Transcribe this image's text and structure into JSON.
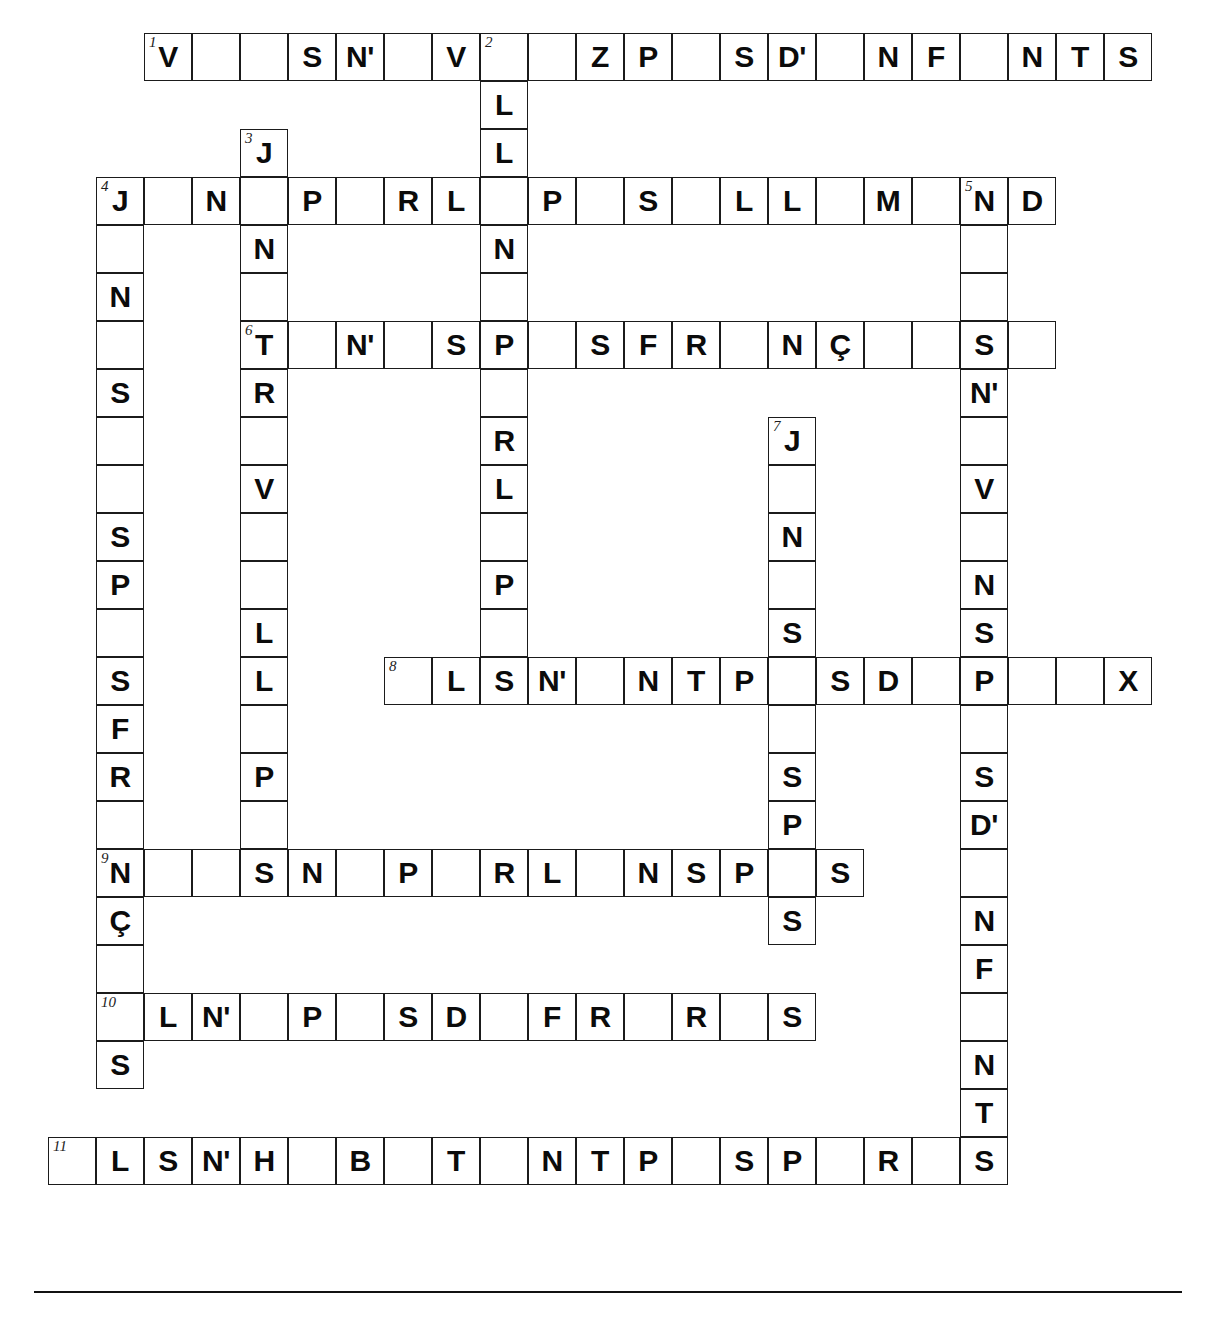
{
  "puzzle": {
    "title": "Crossword grid",
    "geometry": {
      "origin_x": 48,
      "origin_y": 33,
      "cell_size": 48,
      "cols": 24,
      "rows": 26
    },
    "footer_rule": true,
    "cells": [
      {
        "r": 0,
        "c": 2,
        "n": "1",
        "l": "V"
      },
      {
        "r": 0,
        "c": 3,
        "l": ""
      },
      {
        "r": 0,
        "c": 4,
        "l": ""
      },
      {
        "r": 0,
        "c": 5,
        "l": "S"
      },
      {
        "r": 0,
        "c": 6,
        "l": "N'"
      },
      {
        "r": 0,
        "c": 7,
        "l": ""
      },
      {
        "r": 0,
        "c": 8,
        "l": "V"
      },
      {
        "r": 0,
        "c": 9,
        "n": "2",
        "l": ""
      },
      {
        "r": 0,
        "c": 10,
        "l": ""
      },
      {
        "r": 0,
        "c": 11,
        "l": "Z"
      },
      {
        "r": 0,
        "c": 12,
        "l": "P"
      },
      {
        "r": 0,
        "c": 13,
        "l": ""
      },
      {
        "r": 0,
        "c": 14,
        "l": "S"
      },
      {
        "r": 0,
        "c": 15,
        "l": "D'"
      },
      {
        "r": 0,
        "c": 16,
        "l": ""
      },
      {
        "r": 0,
        "c": 17,
        "l": "N"
      },
      {
        "r": 0,
        "c": 18,
        "l": "F"
      },
      {
        "r": 0,
        "c": 19,
        "l": ""
      },
      {
        "r": 0,
        "c": 20,
        "l": "N"
      },
      {
        "r": 0,
        "c": 21,
        "l": "T"
      },
      {
        "r": 0,
        "c": 22,
        "l": "S"
      },
      {
        "r": 1,
        "c": 9,
        "l": "L"
      },
      {
        "r": 2,
        "c": 4,
        "n": "3",
        "l": "J"
      },
      {
        "r": 2,
        "c": 9,
        "l": "L"
      },
      {
        "r": 3,
        "c": 1,
        "n": "4",
        "l": "J"
      },
      {
        "r": 3,
        "c": 2,
        "l": ""
      },
      {
        "r": 3,
        "c": 3,
        "l": "N"
      },
      {
        "r": 3,
        "c": 4,
        "l": ""
      },
      {
        "r": 3,
        "c": 5,
        "l": "P"
      },
      {
        "r": 3,
        "c": 6,
        "l": ""
      },
      {
        "r": 3,
        "c": 7,
        "l": "R"
      },
      {
        "r": 3,
        "c": 8,
        "l": "L"
      },
      {
        "r": 3,
        "c": 9,
        "l": ""
      },
      {
        "r": 3,
        "c": 10,
        "l": "P"
      },
      {
        "r": 3,
        "c": 11,
        "l": ""
      },
      {
        "r": 3,
        "c": 12,
        "l": "S"
      },
      {
        "r": 3,
        "c": 13,
        "l": ""
      },
      {
        "r": 3,
        "c": 14,
        "l": "L"
      },
      {
        "r": 3,
        "c": 15,
        "l": "L"
      },
      {
        "r": 3,
        "c": 16,
        "l": ""
      },
      {
        "r": 3,
        "c": 17,
        "l": "M"
      },
      {
        "r": 3,
        "c": 18,
        "l": ""
      },
      {
        "r": 3,
        "c": 19,
        "n": "5",
        "l": "N"
      },
      {
        "r": 3,
        "c": 20,
        "l": "D"
      },
      {
        "r": 4,
        "c": 1,
        "l": ""
      },
      {
        "r": 4,
        "c": 4,
        "l": "N"
      },
      {
        "r": 4,
        "c": 9,
        "l": "N"
      },
      {
        "r": 4,
        "c": 19,
        "l": ""
      },
      {
        "r": 5,
        "c": 1,
        "l": "N"
      },
      {
        "r": 5,
        "c": 4,
        "l": ""
      },
      {
        "r": 5,
        "c": 9,
        "l": ""
      },
      {
        "r": 5,
        "c": 19,
        "l": ""
      },
      {
        "r": 6,
        "c": 1,
        "l": ""
      },
      {
        "r": 6,
        "c": 4,
        "n": "6",
        "l": "T"
      },
      {
        "r": 6,
        "c": 5,
        "l": ""
      },
      {
        "r": 6,
        "c": 6,
        "l": "N'"
      },
      {
        "r": 6,
        "c": 7,
        "l": ""
      },
      {
        "r": 6,
        "c": 8,
        "l": "S"
      },
      {
        "r": 6,
        "c": 9,
        "l": "P"
      },
      {
        "r": 6,
        "c": 10,
        "l": ""
      },
      {
        "r": 6,
        "c": 11,
        "l": "S"
      },
      {
        "r": 6,
        "c": 12,
        "l": "F"
      },
      {
        "r": 6,
        "c": 13,
        "l": "R"
      },
      {
        "r": 6,
        "c": 14,
        "l": ""
      },
      {
        "r": 6,
        "c": 15,
        "l": "N"
      },
      {
        "r": 6,
        "c": 16,
        "l": "Ç"
      },
      {
        "r": 6,
        "c": 17,
        "l": ""
      },
      {
        "r": 6,
        "c": 18,
        "l": ""
      },
      {
        "r": 6,
        "c": 19,
        "l": "S"
      },
      {
        "r": 6,
        "c": 20,
        "l": ""
      },
      {
        "r": 7,
        "c": 1,
        "l": "S"
      },
      {
        "r": 7,
        "c": 4,
        "l": "R"
      },
      {
        "r": 7,
        "c": 9,
        "l": ""
      },
      {
        "r": 7,
        "c": 19,
        "l": "N'"
      },
      {
        "r": 8,
        "c": 1,
        "l": ""
      },
      {
        "r": 8,
        "c": 4,
        "l": ""
      },
      {
        "r": 8,
        "c": 9,
        "l": "R"
      },
      {
        "r": 8,
        "c": 15,
        "n": "7",
        "l": "J"
      },
      {
        "r": 8,
        "c": 19,
        "l": ""
      },
      {
        "r": 9,
        "c": 1,
        "l": ""
      },
      {
        "r": 9,
        "c": 4,
        "l": "V"
      },
      {
        "r": 9,
        "c": 9,
        "l": "L"
      },
      {
        "r": 9,
        "c": 15,
        "l": ""
      },
      {
        "r": 9,
        "c": 19,
        "l": "V"
      },
      {
        "r": 10,
        "c": 1,
        "l": "S"
      },
      {
        "r": 10,
        "c": 4,
        "l": ""
      },
      {
        "r": 10,
        "c": 9,
        "l": ""
      },
      {
        "r": 10,
        "c": 15,
        "l": "N"
      },
      {
        "r": 10,
        "c": 19,
        "l": ""
      },
      {
        "r": 11,
        "c": 1,
        "l": "P"
      },
      {
        "r": 11,
        "c": 4,
        "l": ""
      },
      {
        "r": 11,
        "c": 9,
        "l": "P"
      },
      {
        "r": 11,
        "c": 15,
        "l": ""
      },
      {
        "r": 11,
        "c": 19,
        "l": "N"
      },
      {
        "r": 12,
        "c": 1,
        "l": ""
      },
      {
        "r": 12,
        "c": 4,
        "l": "L"
      },
      {
        "r": 12,
        "c": 9,
        "l": ""
      },
      {
        "r": 12,
        "c": 15,
        "l": "S"
      },
      {
        "r": 12,
        "c": 19,
        "l": "S"
      },
      {
        "r": 13,
        "c": 1,
        "l": "S"
      },
      {
        "r": 13,
        "c": 4,
        "l": "L"
      },
      {
        "r": 13,
        "c": 7,
        "n": "8",
        "l": ""
      },
      {
        "r": 13,
        "c": 8,
        "l": "L"
      },
      {
        "r": 13,
        "c": 9,
        "l": "S"
      },
      {
        "r": 13,
        "c": 10,
        "l": "N'"
      },
      {
        "r": 13,
        "c": 11,
        "l": ""
      },
      {
        "r": 13,
        "c": 12,
        "l": "N"
      },
      {
        "r": 13,
        "c": 13,
        "l": "T"
      },
      {
        "r": 13,
        "c": 14,
        "l": "P"
      },
      {
        "r": 13,
        "c": 15,
        "l": ""
      },
      {
        "r": 13,
        "c": 16,
        "l": "S"
      },
      {
        "r": 13,
        "c": 17,
        "l": "D"
      },
      {
        "r": 13,
        "c": 18,
        "l": ""
      },
      {
        "r": 13,
        "c": 19,
        "l": "P"
      },
      {
        "r": 13,
        "c": 20,
        "l": ""
      },
      {
        "r": 13,
        "c": 21,
        "l": ""
      },
      {
        "r": 13,
        "c": 22,
        "l": "X"
      },
      {
        "r": 14,
        "c": 1,
        "l": "F"
      },
      {
        "r": 14,
        "c": 4,
        "l": ""
      },
      {
        "r": 14,
        "c": 15,
        "l": ""
      },
      {
        "r": 14,
        "c": 19,
        "l": ""
      },
      {
        "r": 15,
        "c": 1,
        "l": "R"
      },
      {
        "r": 15,
        "c": 4,
        "l": "P"
      },
      {
        "r": 15,
        "c": 15,
        "l": "S"
      },
      {
        "r": 15,
        "c": 19,
        "l": "S"
      },
      {
        "r": 16,
        "c": 1,
        "l": ""
      },
      {
        "r": 16,
        "c": 4,
        "l": ""
      },
      {
        "r": 16,
        "c": 15,
        "l": "P"
      },
      {
        "r": 16,
        "c": 19,
        "l": "D'"
      },
      {
        "r": 17,
        "c": 1,
        "n": "9",
        "l": "N"
      },
      {
        "r": 17,
        "c": 2,
        "l": ""
      },
      {
        "r": 17,
        "c": 3,
        "l": ""
      },
      {
        "r": 17,
        "c": 4,
        "l": "S"
      },
      {
        "r": 17,
        "c": 5,
        "l": "N"
      },
      {
        "r": 17,
        "c": 6,
        "l": ""
      },
      {
        "r": 17,
        "c": 7,
        "l": "P"
      },
      {
        "r": 17,
        "c": 8,
        "l": ""
      },
      {
        "r": 17,
        "c": 9,
        "l": "R"
      },
      {
        "r": 17,
        "c": 10,
        "l": "L"
      },
      {
        "r": 17,
        "c": 11,
        "l": ""
      },
      {
        "r": 17,
        "c": 12,
        "l": "N"
      },
      {
        "r": 17,
        "c": 13,
        "l": "S"
      },
      {
        "r": 17,
        "c": 14,
        "l": "P"
      },
      {
        "r": 17,
        "c": 15,
        "l": ""
      },
      {
        "r": 17,
        "c": 16,
        "l": "S"
      },
      {
        "r": 17,
        "c": 19,
        "l": ""
      },
      {
        "r": 18,
        "c": 1,
        "l": "Ç"
      },
      {
        "r": 18,
        "c": 15,
        "l": "S"
      },
      {
        "r": 18,
        "c": 19,
        "l": "N"
      },
      {
        "r": 19,
        "c": 1,
        "l": ""
      },
      {
        "r": 19,
        "c": 19,
        "l": "F"
      },
      {
        "r": 20,
        "c": 1,
        "n": "10",
        "l": ""
      },
      {
        "r": 20,
        "c": 2,
        "l": "L"
      },
      {
        "r": 20,
        "c": 3,
        "l": "N'"
      },
      {
        "r": 20,
        "c": 4,
        "l": ""
      },
      {
        "r": 20,
        "c": 5,
        "l": "P"
      },
      {
        "r": 20,
        "c": 6,
        "l": ""
      },
      {
        "r": 20,
        "c": 7,
        "l": "S"
      },
      {
        "r": 20,
        "c": 8,
        "l": "D"
      },
      {
        "r": 20,
        "c": 9,
        "l": ""
      },
      {
        "r": 20,
        "c": 10,
        "l": "F"
      },
      {
        "r": 20,
        "c": 11,
        "l": "R"
      },
      {
        "r": 20,
        "c": 12,
        "l": ""
      },
      {
        "r": 20,
        "c": 13,
        "l": "R"
      },
      {
        "r": 20,
        "c": 14,
        "l": ""
      },
      {
        "r": 20,
        "c": 15,
        "l": "S"
      },
      {
        "r": 20,
        "c": 19,
        "l": ""
      },
      {
        "r": 21,
        "c": 1,
        "l": "S"
      },
      {
        "r": 21,
        "c": 19,
        "l": "N"
      },
      {
        "r": 22,
        "c": 19,
        "l": "T"
      },
      {
        "r": 23,
        "c": 0,
        "n": "11",
        "l": ""
      },
      {
        "r": 23,
        "c": 1,
        "l": "L"
      },
      {
        "r": 23,
        "c": 2,
        "l": "S"
      },
      {
        "r": 23,
        "c": 3,
        "l": "N'"
      },
      {
        "r": 23,
        "c": 4,
        "l": "H"
      },
      {
        "r": 23,
        "c": 5,
        "l": ""
      },
      {
        "r": 23,
        "c": 6,
        "l": "B"
      },
      {
        "r": 23,
        "c": 7,
        "l": ""
      },
      {
        "r": 23,
        "c": 8,
        "l": "T"
      },
      {
        "r": 23,
        "c": 9,
        "l": ""
      },
      {
        "r": 23,
        "c": 10,
        "l": "N"
      },
      {
        "r": 23,
        "c": 11,
        "l": "T"
      },
      {
        "r": 23,
        "c": 12,
        "l": "P"
      },
      {
        "r": 23,
        "c": 13,
        "l": ""
      },
      {
        "r": 23,
        "c": 14,
        "l": "S"
      },
      {
        "r": 23,
        "c": 15,
        "l": "P"
      },
      {
        "r": 23,
        "c": 16,
        "l": ""
      },
      {
        "r": 23,
        "c": 17,
        "l": "R"
      },
      {
        "r": 23,
        "c": 18,
        "l": ""
      },
      {
        "r": 23,
        "c": 19,
        "l": "S"
      }
    ],
    "across_entries": [
      {
        "number": "1",
        "row": 0,
        "letters": [
          "V",
          "",
          "",
          "S",
          "N'",
          "",
          "V",
          "",
          "",
          "Z",
          "P",
          "",
          "S",
          "D'",
          "",
          "N",
          "F",
          "",
          "N",
          "T",
          "S"
        ]
      },
      {
        "number": "4",
        "row": 3,
        "letters": [
          "J",
          "",
          "N",
          "",
          "P",
          "",
          "R",
          "L",
          "",
          "P",
          "",
          "S",
          "",
          "L",
          "L",
          "",
          "M",
          "",
          "N",
          "D"
        ]
      },
      {
        "number": "6",
        "row": 6,
        "letters": [
          "T",
          "",
          "N'",
          "",
          "S",
          "P",
          "",
          "S",
          "F",
          "R",
          "",
          "N",
          "Ç",
          "",
          "",
          "S",
          ""
        ]
      },
      {
        "number": "8",
        "row": 13,
        "letters": [
          "",
          "L",
          "S",
          "N'",
          "",
          "N",
          "T",
          "P",
          "",
          "S",
          "D",
          "",
          "P",
          "",
          "",
          "X"
        ]
      },
      {
        "number": "9",
        "row": 17,
        "letters": [
          "N",
          "",
          "",
          "S",
          "N",
          "",
          "P",
          "",
          "R",
          "L",
          "",
          "N",
          "S",
          "P",
          "",
          "S"
        ]
      },
      {
        "number": "10",
        "row": 20,
        "letters": [
          "",
          "L",
          "N'",
          "",
          "P",
          "",
          "S",
          "D",
          "",
          "F",
          "R",
          "",
          "R",
          "",
          "S"
        ]
      },
      {
        "number": "11",
        "row": 23,
        "letters": [
          "",
          "L",
          "S",
          "N'",
          "H",
          "",
          "B",
          "",
          "T",
          "",
          "N",
          "T",
          "P",
          "",
          "S",
          "P",
          "",
          "R",
          "",
          "S"
        ]
      }
    ],
    "down_entries": [
      {
        "number": "2",
        "col": 9,
        "letters": [
          "",
          "L",
          "L",
          "",
          "N",
          "",
          "P",
          "",
          "R",
          "L",
          "",
          "P",
          "",
          "S"
        ]
      },
      {
        "number": "3",
        "col": 4,
        "letters": [
          "J",
          "",
          "N",
          "",
          "T",
          "R",
          "",
          "V",
          "",
          "",
          "L",
          "L",
          "",
          "P",
          "",
          "S"
        ]
      },
      {
        "number": "4",
        "col": 1,
        "letters": [
          "J",
          "",
          "N",
          "",
          "S",
          "",
          "",
          "S",
          "P",
          "",
          "S",
          "F",
          "R",
          "",
          "N",
          "Ç",
          "",
          "",
          "S"
        ]
      },
      {
        "number": "5",
        "col": 19,
        "letters": [
          "N",
          "",
          "",
          "S",
          "N'",
          "",
          "V",
          "",
          "N",
          "S",
          "P",
          "",
          "S",
          "D'",
          "",
          "N",
          "F",
          "",
          "N",
          "T",
          "S"
        ]
      },
      {
        "number": "7",
        "col": 15,
        "letters": [
          "J",
          "",
          "N",
          "",
          "S",
          "",
          "",
          "S",
          "P",
          "",
          "S"
        ]
      }
    ]
  }
}
